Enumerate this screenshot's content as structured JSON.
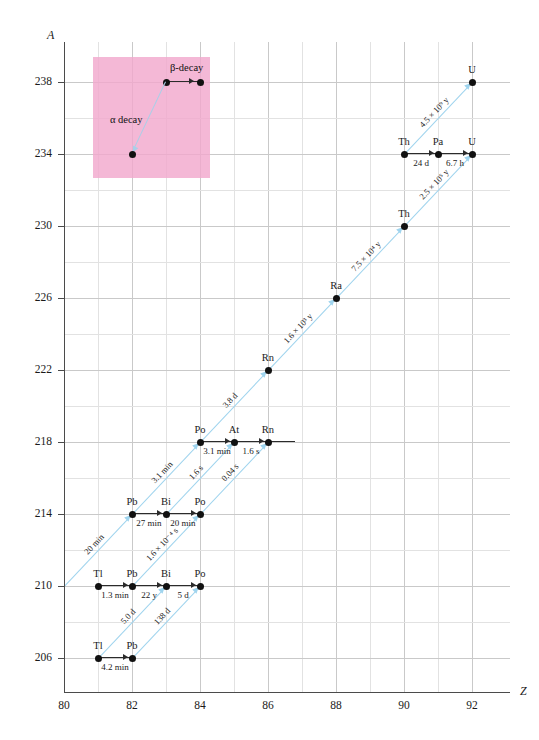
{
  "chart_data": {
    "type": "scatter",
    "title": "",
    "xlabel": "Z",
    "ylabel": "A",
    "xlim": [
      80,
      93
    ],
    "ylim": [
      204,
      240
    ],
    "xticks": [
      80,
      82,
      84,
      86,
      88,
      90,
      92
    ],
    "yticks": [
      238,
      234,
      230,
      226,
      222,
      218,
      214,
      210,
      206
    ],
    "grid": true,
    "legend_position": "none",
    "nuclides": [
      {
        "symbol": "U",
        "Z": 92,
        "A": 238
      },
      {
        "symbol": "Th",
        "Z": 90,
        "A": 234
      },
      {
        "symbol": "Pa",
        "Z": 91,
        "A": 234
      },
      {
        "symbol": "U",
        "Z": 92,
        "A": 234
      },
      {
        "symbol": "Th",
        "Z": 90,
        "A": 230
      },
      {
        "symbol": "Ra",
        "Z": 88,
        "A": 226
      },
      {
        "symbol": "Rn",
        "Z": 86,
        "A": 222
      },
      {
        "symbol": "Po",
        "Z": 84,
        "A": 218
      },
      {
        "symbol": "At",
        "Z": 85,
        "A": 218
      },
      {
        "symbol": "Rn",
        "Z": 86,
        "A": 218
      },
      {
        "symbol": "Pb",
        "Z": 82,
        "A": 214
      },
      {
        "symbol": "Bi",
        "Z": 83,
        "A": 214
      },
      {
        "symbol": "Po",
        "Z": 84,
        "A": 214
      },
      {
        "symbol": "Tl",
        "Z": 81,
        "A": 210
      },
      {
        "symbol": "Pb",
        "Z": 82,
        "A": 210
      },
      {
        "symbol": "Bi",
        "Z": 83,
        "A": 210
      },
      {
        "symbol": "Po",
        "Z": 84,
        "A": 210
      },
      {
        "symbol": "Tl",
        "Z": 81,
        "A": 206
      },
      {
        "symbol": "Pb",
        "Z": 82,
        "A": 206
      }
    ],
    "alpha_decays": [
      {
        "from": {
          "Z": 92,
          "A": 238
        },
        "to": {
          "Z": 90,
          "A": 234
        },
        "half_life": "4.5 × 10⁹ y"
      },
      {
        "from": {
          "Z": 92,
          "A": 234
        },
        "to": {
          "Z": 90,
          "A": 230
        },
        "half_life": "2.5 × 10⁵ y"
      },
      {
        "from": {
          "Z": 90,
          "A": 230
        },
        "to": {
          "Z": 88,
          "A": 226
        },
        "half_life": "7.5 × 10⁴ y"
      },
      {
        "from": {
          "Z": 88,
          "A": 226
        },
        "to": {
          "Z": 86,
          "A": 222
        },
        "half_life": "1.6 × 10³ y"
      },
      {
        "from": {
          "Z": 86,
          "A": 222
        },
        "to": {
          "Z": 84,
          "A": 218
        },
        "half_life": "3.8 d"
      },
      {
        "from": {
          "Z": 84,
          "A": 218
        },
        "to": {
          "Z": 82,
          "A": 214
        },
        "half_life": "3.1 min"
      },
      {
        "from": {
          "Z": 85,
          "A": 218
        },
        "to": {
          "Z": 83,
          "A": 214
        },
        "half_life": "1.6 s"
      },
      {
        "from": {
          "Z": 86,
          "A": 218
        },
        "to": {
          "Z": 84,
          "A": 214
        },
        "half_life": "0.04 s"
      },
      {
        "from": {
          "Z": 82,
          "A": 214
        },
        "to": {
          "Z": 80,
          "A": 210
        },
        "half_life": "20 min"
      },
      {
        "from": {
          "Z": 84,
          "A": 214
        },
        "to": {
          "Z": 82,
          "A": 210
        },
        "half_life": "1.6 × 10⁻⁴ s"
      },
      {
        "from": {
          "Z": 83,
          "A": 210
        },
        "to": {
          "Z": 81,
          "A": 206
        },
        "half_life": "5.0 d"
      },
      {
        "from": {
          "Z": 84,
          "A": 210
        },
        "to": {
          "Z": 82,
          "A": 206
        },
        "half_life": "138 d"
      }
    ],
    "beta_decays": [
      {
        "from": {
          "Z": 90,
          "A": 234
        },
        "to": {
          "Z": 91,
          "A": 234
        },
        "half_life": "24 d"
      },
      {
        "from": {
          "Z": 91,
          "A": 234
        },
        "to": {
          "Z": 92,
          "A": 234
        },
        "half_life": "6.7 h"
      },
      {
        "from": {
          "Z": 84,
          "A": 218
        },
        "to": {
          "Z": 85,
          "A": 218
        },
        "half_life": "3.1 min"
      },
      {
        "from": {
          "Z": 85,
          "A": 218
        },
        "to": {
          "Z": 86,
          "A": 218
        },
        "half_life": "1.6 s"
      },
      {
        "from": {
          "Z": 82,
          "A": 214
        },
        "to": {
          "Z": 83,
          "A": 214
        },
        "half_life": "27 min"
      },
      {
        "from": {
          "Z": 83,
          "A": 214
        },
        "to": {
          "Z": 84,
          "A": 214
        },
        "half_life": "20 min"
      },
      {
        "from": {
          "Z": 81,
          "A": 210
        },
        "to": {
          "Z": 82,
          "A": 210
        },
        "half_life": "1.3 min"
      },
      {
        "from": {
          "Z": 82,
          "A": 210
        },
        "to": {
          "Z": 83,
          "A": 210
        },
        "half_life": "22 y"
      },
      {
        "from": {
          "Z": 83,
          "A": 210
        },
        "to": {
          "Z": 84,
          "A": 210
        },
        "half_life": "5 d"
      },
      {
        "from": {
          "Z": 81,
          "A": 206
        },
        "to": {
          "Z": 82,
          "A": 206
        },
        "half_life": "4.2 min"
      }
    ]
  },
  "axes": {
    "y_title": "A",
    "x_title": "Z",
    "y_ticks": [
      "238",
      "234",
      "230",
      "226",
      "222",
      "218",
      "214",
      "210",
      "206"
    ],
    "x_ticks": [
      "80",
      "82",
      "84",
      "86",
      "88",
      "90",
      "92"
    ]
  },
  "legend_inset": {
    "alpha_label": "α decay",
    "beta_label": "β-decay",
    "box_color": "#f2a8cd"
  },
  "nuclide_labels": [
    "U",
    "Th",
    "Pa",
    "U",
    "Th",
    "Ra",
    "Rn",
    "Po",
    "At",
    "Rn",
    "Pb",
    "Bi",
    "Po",
    "Tl",
    "Pb",
    "Bi",
    "Po",
    "Tl",
    "Pb"
  ],
  "beta_halflife_labels": [
    "24 d",
    "6.7 h",
    "3.1 min",
    "1.6 s",
    "27 min",
    "20 min",
    "1.3 min",
    "22 y",
    "5 d",
    "4.2 min"
  ],
  "alpha_halflife_labels": [
    "4.5 × 10⁹ y",
    "2.5 × 10⁵ y",
    "7.5 × 10⁴ y",
    "1.6 × 10³ y",
    "3.8 d",
    "3.1 min",
    "1.6 s",
    "0.04 s",
    "20 min",
    "1.6 × 10⁻⁴ s",
    "5.0 d",
    "138 d"
  ]
}
